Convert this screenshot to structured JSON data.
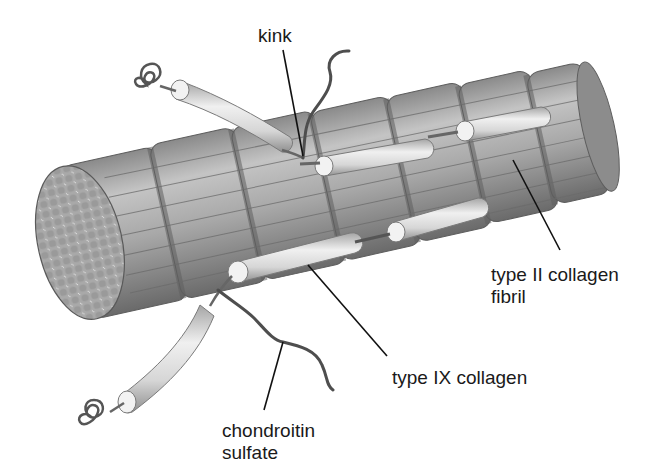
{
  "figure": {
    "colors": {
      "background": "#ffffff",
      "fibril_light": "#bdbdbd",
      "fibril_mid": "#9a9a9a",
      "fibril_dark": "#6e6e6e",
      "type9_rod": "#e6e6e6",
      "chain": "#555555",
      "leader_line": "#111111",
      "label_text": "#1a1a1a"
    }
  },
  "labels": {
    "kink": "kink",
    "type_ii_fibril_line1": "type II collagen",
    "type_ii_fibril_line2": "fibril",
    "type_ix_collagen": "type IX collagen",
    "chondroitin_line1": "chondroitin",
    "chondroitin_line2": "sulfate"
  }
}
